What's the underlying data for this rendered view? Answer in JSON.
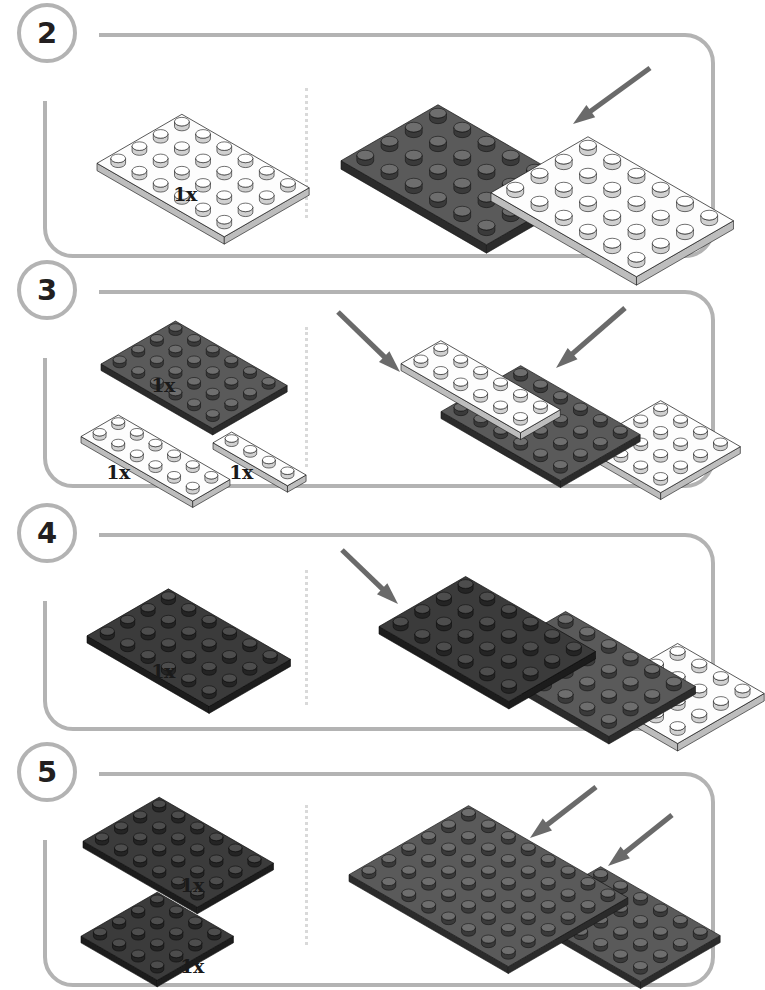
{
  "page": {
    "kind": "lego-building-instructions",
    "width": 743,
    "height": 967,
    "background": "#ffffff",
    "frame_color": "#b3b3b3",
    "divider_color": "#d9d9d9",
    "arrow_color": "#6a6a6a",
    "colors": {
      "white_top": "#fdfdfd",
      "white_side": "#bdbdbd",
      "white_stud": "#ffffff",
      "dark_top": "#5a5a5a",
      "dark_side": "#2b2b2b",
      "dark_stud": "#4a4a4a",
      "black_top": "#3b3b3b",
      "black_side": "#1c1c1c",
      "outline": "#111111"
    }
  },
  "steps": [
    {
      "number": "2",
      "panel": {
        "x": 43,
        "y": 33,
        "w": 672,
        "h": 225
      },
      "divider_x": 305,
      "divider_y": 88,
      "divider_h": 130,
      "parts": [
        {
          "name": "plate-4x6-white",
          "qty": "1x",
          "color": "white",
          "cols": 6,
          "rows": 4,
          "x": 96,
          "y": 103,
          "unit": 24.5,
          "qty_x": 185,
          "qty_y": 183
        }
      ],
      "assembly": [
        {
          "name": "plate-4x6-dark",
          "color": "dark",
          "cols": 6,
          "rows": 4,
          "x": 340,
          "y": 92,
          "unit": 28,
          "z": 1
        },
        {
          "name": "plate-4x6-white",
          "color": "white",
          "cols": 6,
          "rows": 4,
          "x": 490,
          "y": 124,
          "unit": 28,
          "z": 2
        }
      ],
      "arrows": [
        {
          "name": "placement-arrow",
          "x1": 650,
          "y1": 68,
          "x2": 573,
          "y2": 124
        }
      ]
    },
    {
      "number": "3",
      "panel": {
        "x": 43,
        "y": 290,
        "w": 672,
        "h": 198
      },
      "divider_x": 305,
      "divider_y": 327,
      "divider_h": 140,
      "parts": [
        {
          "name": "plate-4x6-dark",
          "qty": "1x",
          "color": "dark",
          "cols": 6,
          "rows": 4,
          "x": 100,
          "y": 311,
          "unit": 21.5,
          "qty_x": 163,
          "qty_y": 374
        },
        {
          "name": "plate-2x6-white",
          "qty": "1x",
          "color": "white",
          "cols": 6,
          "rows": 2,
          "x": 80,
          "y": 405,
          "unit": 21.5,
          "qty_x": 118,
          "qty_y": 461
        },
        {
          "name": "plate-1x4-white",
          "qty": "1x",
          "color": "white",
          "cols": 4,
          "rows": 1,
          "x": 212,
          "y": 422,
          "unit": 21.5,
          "qty_x": 241,
          "qty_y": 461
        }
      ],
      "assembly": [
        {
          "name": "plate-2x6-white",
          "color": "white",
          "cols": 6,
          "rows": 2,
          "x": 400,
          "y": 330,
          "unit": 23,
          "z": 3
        },
        {
          "name": "plate-4x6-dark",
          "color": "dark",
          "cols": 6,
          "rows": 4,
          "x": 440,
          "y": 355,
          "unit": 23,
          "z": 2
        },
        {
          "name": "plate-4x4-white",
          "color": "white",
          "cols": 4,
          "rows": 4,
          "x": 580,
          "y": 390,
          "unit": 23,
          "z": 1
        }
      ],
      "arrows": [
        {
          "name": "placement-arrow-left",
          "x1": 338,
          "y1": 312,
          "x2": 400,
          "y2": 372
        },
        {
          "name": "placement-arrow-right",
          "x1": 625,
          "y1": 308,
          "x2": 556,
          "y2": 368
        }
      ]
    },
    {
      "number": "4",
      "panel": {
        "x": 43,
        "y": 533,
        "w": 672,
        "h": 198
      },
      "divider_x": 305,
      "divider_y": 570,
      "divider_h": 135,
      "parts": [
        {
          "name": "plate-4x6-black",
          "qty": "1x",
          "color": "black",
          "cols": 6,
          "rows": 4,
          "x": 86,
          "y": 578,
          "unit": 23.5,
          "qty_x": 163,
          "qty_y": 660
        }
      ],
      "assembly": [
        {
          "name": "plate-4x6-black",
          "color": "black",
          "cols": 6,
          "rows": 4,
          "x": 378,
          "y": 565,
          "unit": 25,
          "z": 3
        },
        {
          "name": "plate-4x6-dark",
          "color": "dark",
          "cols": 6,
          "rows": 4,
          "x": 478,
          "y": 600,
          "unit": 25,
          "z": 2
        },
        {
          "name": "plate-4x4-white",
          "color": "white",
          "cols": 4,
          "rows": 4,
          "x": 590,
          "y": 632,
          "unit": 25,
          "z": 1
        }
      ],
      "arrows": [
        {
          "name": "placement-arrow",
          "x1": 342,
          "y1": 550,
          "x2": 398,
          "y2": 604
        }
      ]
    },
    {
      "number": "5",
      "panel": {
        "x": 43,
        "y": 772,
        "w": 672,
        "h": 215
      },
      "divider_x": 305,
      "divider_y": 805,
      "divider_h": 140,
      "parts": [
        {
          "name": "plate-4x6-black",
          "qty": "1x",
          "color": "black",
          "cols": 6,
          "rows": 4,
          "x": 82,
          "y": 787,
          "unit": 22,
          "qty_x": 192,
          "qty_y": 874
        },
        {
          "name": "plate-4x4-black",
          "qty": "1x",
          "color": "black",
          "cols": 4,
          "rows": 4,
          "x": 80,
          "y": 882,
          "unit": 22,
          "qty_x": 192,
          "qty_y": 955
        }
      ],
      "assembly": [
        {
          "name": "plate-6x8-dark",
          "color": "dark",
          "cols": 8,
          "rows": 6,
          "x": 348,
          "y": 795,
          "unit": 23,
          "z": 2
        },
        {
          "name": "plate-4x6-dark",
          "color": "dark",
          "cols": 6,
          "rows": 4,
          "x": 520,
          "y": 856,
          "unit": 23,
          "z": 1
        }
      ],
      "arrows": [
        {
          "name": "placement-arrow-left",
          "x1": 596,
          "y1": 787,
          "x2": 530,
          "y2": 838
        },
        {
          "name": "placement-arrow-right",
          "x1": 672,
          "y1": 815,
          "x2": 608,
          "y2": 866
        }
      ]
    }
  ]
}
